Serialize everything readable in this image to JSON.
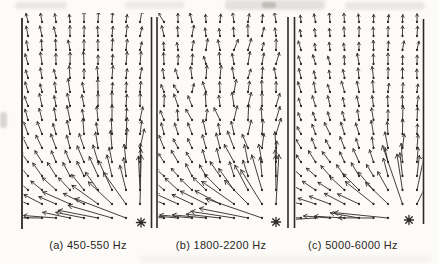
{
  "figure": {
    "background": "#fcfbf8",
    "ink": "#2c2a26",
    "artifact_color": "#b9b7b0"
  },
  "frame_lines": [
    {
      "x": 22.0,
      "y0": 18,
      "y1": 229,
      "w": 1.8
    },
    {
      "x": 151.5,
      "y0": 17,
      "y1": 228,
      "w": 1.6
    },
    {
      "x": 157.0,
      "y0": 17,
      "y1": 228,
      "w": 1.6
    },
    {
      "x": 288.0,
      "y0": 17,
      "y1": 228,
      "w": 1.6
    },
    {
      "x": 294.5,
      "y0": 17,
      "y1": 228,
      "w": 1.6
    },
    {
      "x": 423.5,
      "y0": 19,
      "y1": 224,
      "w": 1.6
    }
  ],
  "captions": {
    "a_center_x": 88,
    "b_center_x": 221,
    "c_center_x": 353
  },
  "chart_data": [
    {
      "type": "quiver",
      "title": "(a) 450-550 Hz",
      "frequency_band_hz": [
        450,
        550
      ],
      "grid": {
        "cols": 9,
        "rows": 15,
        "x_px": [
          28,
          140
        ],
        "y_px": [
          22,
          218
        ]
      },
      "source_px": {
        "x": 141,
        "y": 222.5
      },
      "source_marker": "asterisk",
      "legend": "none",
      "axes": "none (framed strip, vertical border lines only)",
      "field_description": "Intensity vectors radiate from source at lower right; very long vectors near source, long leftward vectors along the bottom edge, short near-vertical upward vectors fanning slightly outward in the upper far field.",
      "model": {
        "seed": 3,
        "jitter_deg": 7,
        "jitter_grow": false,
        "fan_deg": 10,
        "blend_h": 75,
        "len_base": 5,
        "len_c": 850,
        "len_max": 58,
        "floor_boost": 14,
        "clip": [
          23.5,
          13,
          125.5,
          220
        ]
      }
    },
    {
      "type": "quiver",
      "title": "(b) 1800-2200 Hz",
      "frequency_band_hz": [
        1800,
        2200
      ],
      "grid": {
        "cols": 9,
        "rows": 15,
        "x_px": [
          164,
          276
        ],
        "y_px": [
          22,
          218
        ]
      },
      "source_px": {
        "x": 276,
        "y": 222
      },
      "source_marker": "asterisk",
      "legend": "none",
      "axes": "none (double divider lines both sides)",
      "field_description": "Same source at lower right but upper/mid field is disordered (diffuse): short vectors with strongly varying tilt; long left-pointing vectors along bottom and long radial vectors near source.",
      "model": {
        "seed": 7,
        "jitter_deg": 26,
        "jitter_grow": true,
        "fan_deg": 6,
        "blend_h": 85,
        "len_base": 5,
        "len_c": 800,
        "len_max": 55,
        "floor_boost": 16,
        "clip": [
          158.5,
          13,
          128.5,
          220
        ]
      }
    },
    {
      "type": "quiver",
      "title": "(c) 5000-6000 Hz",
      "frequency_band_hz": [
        5000,
        6000
      ],
      "grid": {
        "cols": 9,
        "rows": 15,
        "x_px": [
          301,
          417
        ],
        "y_px": [
          22,
          218
        ]
      },
      "source_px": {
        "x": 409,
        "y": 220
      },
      "source_marker": "asterisk",
      "legend": "none",
      "axes": "none (framed strip, vertical border lines only)",
      "field_description": "Clean radial pattern: vectors point away from the lower-right source with diagonals reaching high up the right side; short uniform upward vectors at top, leftward vectors along bottom.",
      "model": {
        "seed": 5,
        "jitter_deg": 9,
        "jitter_grow": false,
        "fan_deg": 7,
        "blend_h": 105,
        "len_base": 4.5,
        "len_c": 680,
        "len_max": 50,
        "floor_boost": 12,
        "clip": [
          296,
          13,
          126.5,
          220
        ]
      }
    }
  ]
}
